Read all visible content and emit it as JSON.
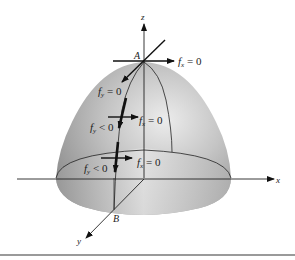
{
  "figure": {
    "axes": {
      "x_label": "x",
      "y_label": "y",
      "z_label": "z"
    },
    "points": {
      "top_point": "A",
      "base_point": "B"
    },
    "annotations": {
      "fx_top": "f",
      "fx_top_sub": "x",
      "fx_top_eq": " = 0",
      "fy_top": "f",
      "fy_top_sub": "y",
      "fy_top_eq": " = 0",
      "fy_mid": "f",
      "fy_mid_sub": "y",
      "fy_mid_eq": " < 0",
      "fx_mid": "f",
      "fx_mid_sub": "x",
      "fx_mid_eq": " = 0",
      "fy_low": "f",
      "fy_low_sub": "y",
      "fy_low_eq": " < 0",
      "fx_low": "f",
      "fx_low_sub": "x",
      "fx_low_eq": " = 0"
    },
    "colors": {
      "surface_light": "#e6e6e6",
      "surface_dark": "#8a8a8a",
      "ink": "#1a1a1a"
    }
  }
}
